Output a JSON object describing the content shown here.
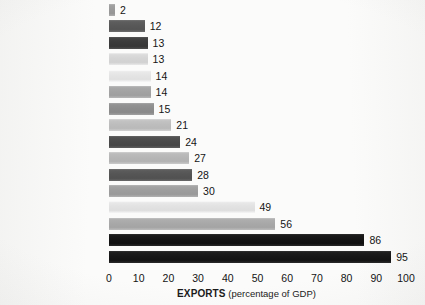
{
  "chart_data": {
    "type": "bar",
    "orientation": "horizontal",
    "title": "",
    "xlabel": "EXPORTS (percentage of GDP)",
    "xlabel_strong": "EXPORTS",
    "xlabel_rest": " (percentage of GDP)",
    "ylabel": "",
    "xlim": [
      0,
      100
    ],
    "xticks": [
      0,
      10,
      20,
      30,
      40,
      50,
      60,
      70,
      80,
      90,
      100
    ],
    "grid": false,
    "legend": "none",
    "categories": [
      "Myanmar",
      "Pakistan",
      "Brazil",
      "Haiti",
      "Ethiopia",
      "United States",
      "Japan",
      "Australia",
      "India",
      "China",
      "Great Britain",
      "Canada",
      "Sweden",
      "Korea (South)",
      "Belgium",
      "United Arab Emirates"
    ],
    "values": [
      2,
      12,
      13,
      13,
      14,
      14,
      15,
      21,
      24,
      27,
      28,
      30,
      49,
      56,
      86,
      95
    ],
    "bars": [
      {
        "label": "Myanmar",
        "value": 2,
        "value_text": "2",
        "color": "#9a9a9a",
        "emphasis": false
      },
      {
        "label": "Pakistan",
        "value": 12,
        "value_text": "12",
        "color": "#585858",
        "emphasis": false
      },
      {
        "label": "Brazil",
        "value": 13,
        "value_text": "13",
        "color": "#3b3b3b",
        "emphasis": false
      },
      {
        "label": "Haiti",
        "value": 13,
        "value_text": "13",
        "color": "#d5d5d5",
        "emphasis": false
      },
      {
        "label": "Ethiopia",
        "value": 14,
        "value_text": "14",
        "color": "#e4e4e4",
        "emphasis": false
      },
      {
        "label": "United States",
        "value": 14,
        "value_text": "14",
        "color": "#a3a3a3",
        "emphasis": true
      },
      {
        "label": "Japan",
        "value": 15,
        "value_text": "15",
        "color": "#8d8d8d",
        "emphasis": false
      },
      {
        "label": "Australia",
        "value": 21,
        "value_text": "21",
        "color": "#bdbdbd",
        "emphasis": false
      },
      {
        "label": "India",
        "value": 24,
        "value_text": "24",
        "color": "#4a4a4a",
        "emphasis": false
      },
      {
        "label": "China",
        "value": 27,
        "value_text": "27",
        "color": "#b6b6b6",
        "emphasis": false
      },
      {
        "label": "Great Britain",
        "value": 28,
        "value_text": "28",
        "color": "#555555",
        "emphasis": false
      },
      {
        "label": "Canada",
        "value": 30,
        "value_text": "30",
        "color": "#9d9d9d",
        "emphasis": false
      },
      {
        "label": "Sweden",
        "value": 49,
        "value_text": "49",
        "color": "#e2e2e2",
        "emphasis": false
      },
      {
        "label": "Korea (South)",
        "value": 56,
        "value_text": "56",
        "color": "#a8a8a8",
        "emphasis": false
      },
      {
        "label": "Belgium",
        "value": 86,
        "value_text": "86",
        "color": "#141414",
        "emphasis": false
      },
      {
        "label": "United Arab Emirates",
        "value": 95,
        "value_text": "95",
        "color": "#171717",
        "emphasis": false
      }
    ]
  },
  "colors": {
    "background": "#fbfbfa",
    "text": "#141414"
  }
}
